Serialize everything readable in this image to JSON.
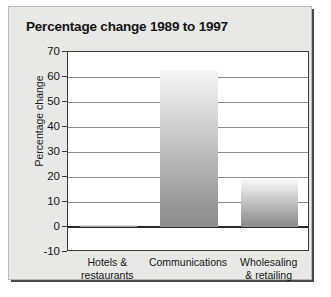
{
  "chart_data": {
    "type": "bar",
    "title": "Percentage change 1989 to 1997",
    "xlabel": "",
    "ylabel": "Percentage change",
    "categories": [
      "Hotels & restaurants",
      "Communications",
      "Wholesaling & retailing"
    ],
    "category_lines": [
      [
        "Hotels &",
        "restaurants"
      ],
      [
        "Communications",
        ""
      ],
      [
        "Wholesaling",
        "& retailing"
      ]
    ],
    "values": [
      1,
      63,
      19
    ],
    "ylim": [
      -10,
      70
    ],
    "yticks": [
      70,
      60,
      50,
      40,
      30,
      20,
      10,
      0,
      -10
    ],
    "ytick_labels": [
      "70",
      "60",
      "50",
      "40",
      "30",
      "20",
      "10",
      "0",
      "-10"
    ],
    "grid": true,
    "legend": "none",
    "zero_line": 0,
    "colors": {
      "panel_background": "#e8e8e6",
      "plot_background": "#ffffff",
      "bar_gradient_top": "#f7f7f7",
      "bar_gradient_bottom": "#8d8d8d",
      "gridline": "#8c8c8c",
      "axis": "#3c3c3c",
      "text": "#161616",
      "title_text": "#141414",
      "shadow": "#4a4a4a"
    }
  }
}
